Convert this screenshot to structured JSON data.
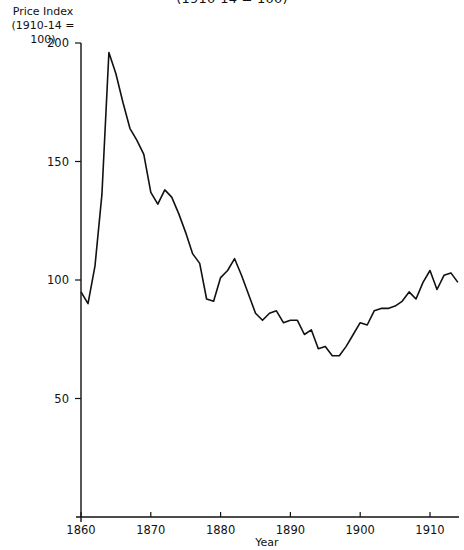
{
  "header": {
    "title_fragment": "(1910-14 = 100)"
  },
  "axes": {
    "y_label_line1": "Price Index",
    "y_label_line2": "(1910-14 = 100)",
    "x_label": "Year"
  },
  "chart_data": {
    "type": "line",
    "title": "(1910-14 = 100)",
    "xlabel": "Year",
    "ylabel": "Price Index (1910-14 = 100)",
    "xlim": [
      1860,
      1914
    ],
    "ylim": [
      0,
      200
    ],
    "x_ticks": [
      1860,
      1870,
      1880,
      1890,
      1900,
      1910
    ],
    "y_ticks": [
      50,
      100,
      150,
      200
    ],
    "grid": false,
    "legend": null,
    "series": [
      {
        "name": "Price Index",
        "x": [
          1860,
          1861,
          1862,
          1863,
          1864,
          1865,
          1866,
          1867,
          1868,
          1869,
          1870,
          1871,
          1872,
          1873,
          1874,
          1875,
          1876,
          1877,
          1878,
          1879,
          1880,
          1881,
          1882,
          1883,
          1884,
          1885,
          1886,
          1887,
          1888,
          1889,
          1890,
          1891,
          1892,
          1893,
          1894,
          1895,
          1896,
          1897,
          1898,
          1899,
          1900,
          1901,
          1902,
          1903,
          1904,
          1905,
          1906,
          1907,
          1908,
          1909,
          1910,
          1911,
          1912,
          1913,
          1914
        ],
        "values": [
          95,
          90,
          106,
          136,
          196,
          187,
          175,
          164,
          159,
          153,
          137,
          132,
          138,
          135,
          128,
          120,
          111,
          107,
          92,
          91,
          101,
          104,
          109,
          102,
          94,
          86,
          83,
          86,
          87,
          82,
          83,
          83,
          77,
          79,
          71,
          72,
          68,
          68,
          72,
          77,
          82,
          81,
          87,
          88,
          88,
          89,
          91,
          95,
          92,
          99,
          104,
          96,
          102,
          103,
          99
        ]
      }
    ]
  }
}
